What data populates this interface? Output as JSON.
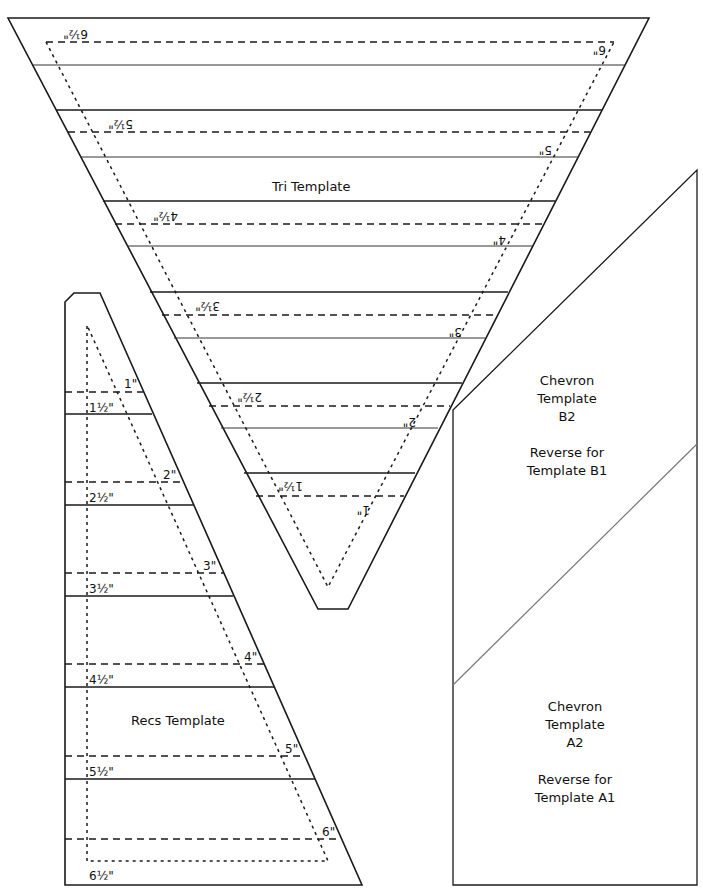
{
  "tri_template": {
    "title": "Tri Template",
    "upside_down_labels": [
      "6½\"",
      "6\"",
      "5½\"",
      "5\"",
      "4½\"",
      "4\"",
      "3½\"",
      "3\"",
      "2½\"",
      "2\"",
      "1½\"",
      "1\""
    ]
  },
  "recs_template": {
    "title": "Recs Template",
    "labels": [
      "1\"",
      "1½\"",
      "2\"",
      "2½\"",
      "3\"",
      "3½\"",
      "4\"",
      "4½\"",
      "5\"",
      "5½\"",
      "6\"",
      "6½\""
    ]
  },
  "chevron_b": {
    "line1": "Chevron",
    "line2": "Template",
    "line3": "B2",
    "note1": "Reverse for",
    "note2": "Template B1"
  },
  "chevron_a": {
    "line1": "Chevron",
    "line2": "Template",
    "line3": "A2",
    "note1": "Reverse for",
    "note2": "Template A1"
  }
}
